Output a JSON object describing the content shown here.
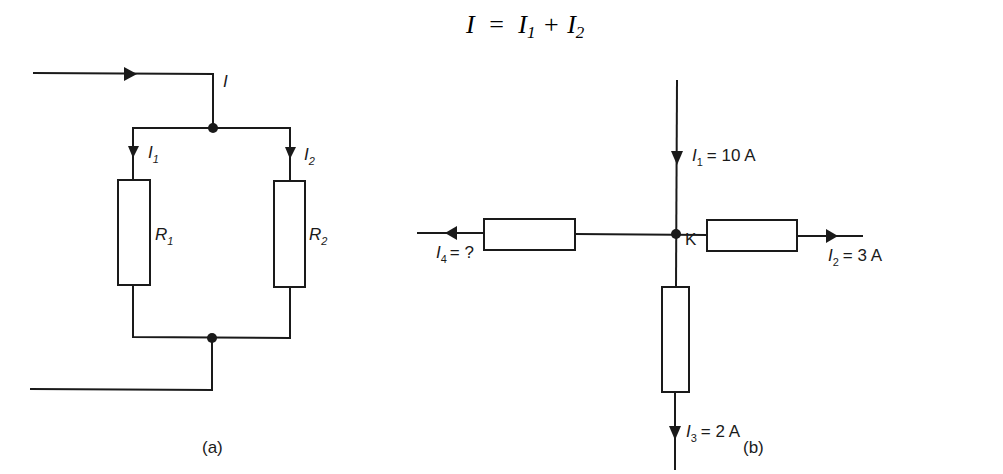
{
  "equation": {
    "lhs": "I",
    "equals": "=",
    "term1": "I",
    "term1_sub": "1",
    "plus": "+",
    "term2": "I",
    "term2_sub": "2"
  },
  "figure_a": {
    "caption": "(a)",
    "input_current_label": "I",
    "branch1": {
      "current_label": "I",
      "current_sub": "1",
      "resistor_label": "R",
      "resistor_sub": "1"
    },
    "branch2": {
      "current_label": "I",
      "current_sub": "2",
      "resistor_label": "R",
      "resistor_sub": "2"
    }
  },
  "figure_b": {
    "caption": "(b)",
    "node_label": "K",
    "currents": [
      {
        "name": "I",
        "sub": "1",
        "value": "= 10 A",
        "direction": "into node (from top)"
      },
      {
        "name": "I",
        "sub": "2",
        "value": "= 3 A",
        "direction": "out of node (to right)"
      },
      {
        "name": "I",
        "sub": "3",
        "value": "= 2 A",
        "direction": "out of node (downward)"
      },
      {
        "name": "I",
        "sub": "4",
        "value": "= ?",
        "direction": "out of node (to left)"
      }
    ]
  },
  "colors": {
    "line": "#1a1a1a",
    "background": "#ffffff"
  }
}
